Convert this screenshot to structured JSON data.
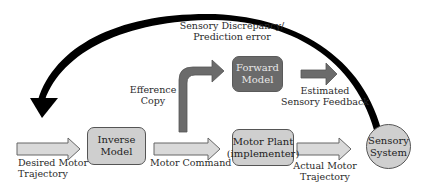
{
  "diagram": {
    "feedback_label": [
      "Sensory Discrepancy/",
      "Prediction error"
    ],
    "nodes": {
      "inverse_model": [
        "Inverse",
        "Model"
      ],
      "forward_model": [
        "Forward",
        "Model"
      ],
      "motor_plant": [
        "Motor Plant",
        "(implementer)"
      ],
      "sensory_system": [
        "Sensory",
        "System"
      ]
    },
    "edge_labels": {
      "desired_motor_trajectory": [
        "Desired Motor",
        "Trajectory"
      ],
      "motor_command": [
        "Motor Command"
      ],
      "efference_copy": [
        "Efference",
        "Copy"
      ],
      "estimated_sensory_feedback": [
        "Estimated",
        "Sensory Feedback"
      ],
      "actual_motor_trajectory": [
        "Actual Motor",
        "Trajectory"
      ]
    },
    "colors": {
      "light_fill": "#cfcfcf",
      "dark_fill": "#6a6a6a",
      "arrow_dark": "#6b6b6b",
      "feedback_arrow": "#000000"
    }
  }
}
